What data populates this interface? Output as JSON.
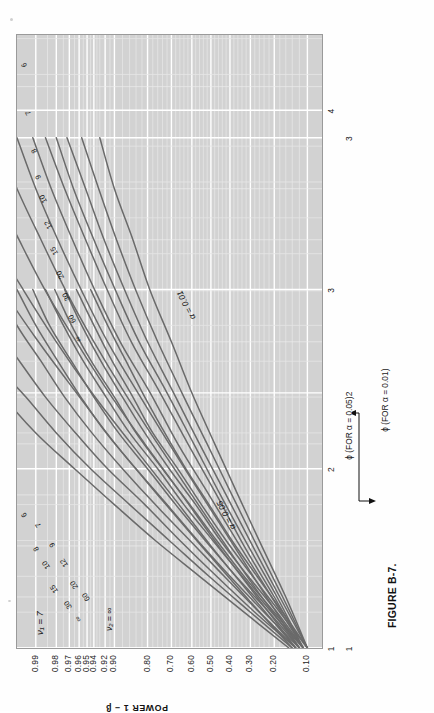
{
  "figure": {
    "caption": "FIGURE B-7.",
    "orientation": "rotated-90-ccw"
  },
  "colors": {
    "plot_background": "#d2d2d2",
    "grid_line": "#ffffff",
    "grid_minor": "#e4e4e4",
    "curve": "#6a6a6a",
    "frame": "#9a9a9a",
    "text": "#111111",
    "page_background": "#fefefe"
  },
  "axes": {
    "y_title": "POWER 1 − β",
    "y_ticks": [
      "0.99",
      "0.98",
      "0.97",
      "0.96",
      "0.95",
      "0.94",
      "0.92",
      "0.90",
      "0.80",
      "0.70",
      "0.60",
      "0.50",
      "0.40",
      "0.30",
      "0.20",
      "0.10"
    ],
    "phi05_label": "ϕ (FOR α = 0.05)",
    "phi05_ticks": [
      "1",
      "2",
      "3",
      "4"
    ],
    "phi01_label": "ϕ (FOR α = 0.01)",
    "phi01_ticks": [
      "1",
      "2",
      "3"
    ]
  },
  "annotations": {
    "nu_numerator": "ν₁ = 7",
    "nu_denominator": "ν₂ = ∞",
    "alpha_005": "α = 0.05",
    "alpha_001": "α = 0.01"
  },
  "curve_labels": [
    "∞",
    "60",
    "30",
    "20",
    "15",
    "12",
    "10",
    "9",
    "8",
    "7",
    "6"
  ],
  "chart_data": {
    "type": "line",
    "title": "FIGURE B-7.",
    "subtitle": "Pearson–Hartley power curves for the analysis of variance, ν₁ = 7",
    "xlabel": "ϕ (FOR α = 0.05)  /  ϕ (FOR α = 0.01)",
    "ylabel": "POWER 1 − β",
    "grid": true,
    "legend": "curve-end labels (ν₂ denominator degrees of freedom)",
    "y_tick_values": [
      0.99,
      0.98,
      0.97,
      0.96,
      0.95,
      0.94,
      0.92,
      0.9,
      0.8,
      0.7,
      0.6,
      0.5,
      0.4,
      0.3,
      0.2,
      0.1
    ],
    "y_tick_labels": [
      "0.99",
      "0.98",
      "0.97",
      "0.96",
      "0.95",
      "0.94",
      "0.92",
      "0.90",
      "0.80",
      "0.70",
      "0.60",
      "0.50",
      "0.40",
      "0.30",
      "0.20",
      "0.10"
    ],
    "panels": [
      {
        "name": "alpha = 0.05",
        "alpha": 0.05,
        "x_ticks": [
          1,
          2,
          3,
          4
        ],
        "xlim": [
          1,
          4.4
        ],
        "series": [
          {
            "name": "ν₂ = 6",
            "x": [
              1.0,
              1.2,
              1.4,
              1.6,
              1.8,
              2.0,
              2.2,
              2.4,
              2.6,
              2.8,
              3.0
            ],
            "y": [
              0.1,
              0.17,
              0.27,
              0.39,
              0.51,
              0.63,
              0.73,
              0.81,
              0.87,
              0.915,
              0.945
            ]
          },
          {
            "name": "ν₂ = 7",
            "x": [
              1.0,
              1.2,
              1.4,
              1.6,
              1.8,
              2.0,
              2.2,
              2.4,
              2.6,
              2.8,
              3.0
            ],
            "y": [
              0.1,
              0.18,
              0.29,
              0.42,
              0.55,
              0.67,
              0.78,
              0.85,
              0.905,
              0.94,
              0.963
            ]
          },
          {
            "name": "ν₂ = 8",
            "x": [
              1.0,
              1.2,
              1.4,
              1.6,
              1.8,
              2.0,
              2.2,
              2.4,
              2.6,
              2.8,
              3.0
            ],
            "y": [
              0.11,
              0.19,
              0.31,
              0.45,
              0.58,
              0.71,
              0.81,
              0.88,
              0.928,
              0.957,
              0.974
            ]
          },
          {
            "name": "ν₂ = 9",
            "x": [
              1.0,
              1.2,
              1.4,
              1.6,
              1.8,
              2.0,
              2.2,
              2.4,
              2.6,
              2.8,
              3.0
            ],
            "y": [
              0.11,
              0.2,
              0.33,
              0.47,
              0.61,
              0.74,
              0.84,
              0.9,
              0.944,
              0.968,
              0.981
            ]
          },
          {
            "name": "ν₂ = 10",
            "x": [
              1.0,
              1.2,
              1.4,
              1.6,
              1.8,
              2.0,
              2.2,
              2.4,
              2.6,
              2.8,
              3.0
            ],
            "y": [
              0.11,
              0.21,
              0.34,
              0.49,
              0.64,
              0.76,
              0.86,
              0.918,
              0.955,
              0.975,
              0.986
            ]
          },
          {
            "name": "ν₂ = 12",
            "x": [
              1.0,
              1.2,
              1.4,
              1.6,
              1.8,
              2.0,
              2.2,
              2.4,
              2.6,
              2.8,
              3.0
            ],
            "y": [
              0.12,
              0.22,
              0.37,
              0.53,
              0.68,
              0.8,
              0.89,
              0.94,
              0.968,
              0.984,
              0.991
            ]
          },
          {
            "name": "ν₂ = 15",
            "x": [
              1.0,
              1.2,
              1.4,
              1.6,
              1.8,
              2.0,
              2.2,
              2.4,
              2.6,
              2.8,
              3.0
            ],
            "y": [
              0.12,
              0.24,
              0.4,
              0.57,
              0.72,
              0.84,
              0.918,
              0.958,
              0.979,
              0.99,
              0.995
            ]
          },
          {
            "name": "ν₂ = 20",
            "x": [
              1.0,
              1.2,
              1.4,
              1.6,
              1.8,
              2.0,
              2.2,
              2.4,
              2.6,
              2.8,
              3.0
            ],
            "y": [
              0.13,
              0.26,
              0.43,
              0.61,
              0.77,
              0.88,
              0.943,
              0.974,
              0.988,
              0.995,
              0.9975
            ]
          },
          {
            "name": "ν₂ = 30",
            "x": [
              1.0,
              1.2,
              1.4,
              1.6,
              1.8,
              2.0,
              2.2,
              2.4,
              2.6,
              2.8,
              3.0
            ],
            "y": [
              0.13,
              0.28,
              0.47,
              0.66,
              0.81,
              0.915,
              0.964,
              0.986,
              0.9945,
              0.998,
              0.9992
            ]
          },
          {
            "name": "ν₂ = 60",
            "x": [
              1.0,
              1.2,
              1.4,
              1.6,
              1.8,
              2.0,
              2.2,
              2.4,
              2.6,
              2.8,
              3.0
            ],
            "y": [
              0.14,
              0.3,
              0.51,
              0.71,
              0.86,
              0.945,
              0.98,
              0.993,
              0.998,
              0.9993,
              0.9998
            ]
          },
          {
            "name": "ν₂ = ∞",
            "x": [
              1.0,
              1.2,
              1.4,
              1.6,
              1.8,
              2.0,
              2.2,
              2.4,
              2.6,
              2.8,
              3.0
            ],
            "y": [
              0.15,
              0.33,
              0.56,
              0.77,
              0.9,
              0.965,
              0.99,
              0.997,
              0.9992,
              0.9998,
              0.99995
            ]
          }
        ]
      },
      {
        "name": "alpha = 0.01",
        "alpha": 0.01,
        "x_ticks": [
          1,
          2,
          3
        ],
        "xlim": [
          1,
          3.4
        ],
        "series": [
          {
            "name": "ν₂ = 6",
            "x": [
              1.0,
              1.2,
              1.4,
              1.6,
              1.8,
              2.0,
              2.2,
              2.4,
              2.6,
              2.8,
              3.0
            ],
            "y": [
              0.1,
              0.16,
              0.25,
              0.36,
              0.48,
              0.6,
              0.7,
              0.79,
              0.85,
              0.9,
              0.93
            ]
          },
          {
            "name": "ν₂ = 7",
            "x": [
              1.0,
              1.2,
              1.4,
              1.6,
              1.8,
              2.0,
              2.2,
              2.4,
              2.6,
              2.8,
              3.0
            ],
            "y": [
              0.1,
              0.17,
              0.27,
              0.39,
              0.52,
              0.65,
              0.76,
              0.84,
              0.895,
              0.932,
              0.957
            ]
          },
          {
            "name": "ν₂ = 8",
            "x": [
              1.0,
              1.2,
              1.4,
              1.6,
              1.8,
              2.0,
              2.2,
              2.4,
              2.6,
              2.8,
              3.0
            ],
            "y": [
              0.1,
              0.18,
              0.29,
              0.42,
              0.56,
              0.69,
              0.8,
              0.873,
              0.922,
              0.952,
              0.972
            ]
          },
          {
            "name": "ν₂ = 9",
            "x": [
              1.0,
              1.2,
              1.4,
              1.6,
              1.8,
              2.0,
              2.2,
              2.4,
              2.6,
              2.8,
              3.0
            ],
            "y": [
              0.11,
              0.19,
              0.31,
              0.45,
              0.59,
              0.72,
              0.83,
              0.897,
              0.94,
              0.966,
              0.98
            ]
          },
          {
            "name": "ν₂ = 10",
            "x": [
              1.0,
              1.2,
              1.4,
              1.6,
              1.8,
              2.0,
              2.2,
              2.4,
              2.6,
              2.8,
              3.0
            ],
            "y": [
              0.11,
              0.2,
              0.33,
              0.47,
              0.62,
              0.75,
              0.855,
              0.915,
              0.952,
              0.974,
              0.986
            ]
          },
          {
            "name": "ν₂ = 12",
            "x": [
              1.0,
              1.2,
              1.4,
              1.6,
              1.8,
              2.0,
              2.2,
              2.4,
              2.6,
              2.8,
              3.0
            ],
            "y": [
              0.11,
              0.21,
              0.35,
              0.51,
              0.67,
              0.79,
              0.886,
              0.938,
              0.967,
              0.983,
              0.991
            ]
          },
          {
            "name": "ν₂ = 15",
            "x": [
              1.0,
              1.2,
              1.4,
              1.6,
              1.8,
              2.0,
              2.2,
              2.4,
              2.6,
              2.8,
              3.0
            ],
            "y": [
              0.12,
              0.23,
              0.38,
              0.55,
              0.71,
              0.834,
              0.915,
              0.957,
              0.979,
              0.99,
              0.995
            ]
          },
          {
            "name": "ν₂ = 20",
            "x": [
              1.0,
              1.2,
              1.4,
              1.6,
              1.8,
              2.0,
              2.2,
              2.4,
              2.6,
              2.8,
              3.0
            ],
            "y": [
              0.12,
              0.25,
              0.42,
              0.6,
              0.76,
              0.874,
              0.94,
              0.973,
              0.988,
              0.995,
              0.9978
            ]
          },
          {
            "name": "ν₂ = 30",
            "x": [
              1.0,
              1.2,
              1.4,
              1.6,
              1.8,
              2.0,
              2.2,
              2.4,
              2.6,
              2.8,
              3.0
            ],
            "y": [
              0.13,
              0.27,
              0.46,
              0.65,
              0.81,
              0.912,
              0.963,
              0.986,
              0.9946,
              0.998,
              0.9993
            ]
          },
          {
            "name": "ν₂ = 60",
            "x": [
              1.0,
              1.2,
              1.4,
              1.6,
              1.8,
              2.0,
              2.2,
              2.4,
              2.6,
              2.8,
              3.0
            ],
            "y": [
              0.13,
              0.29,
              0.5,
              0.7,
              0.855,
              0.943,
              0.98,
              0.9935,
              0.998,
              0.9994,
              0.9998
            ]
          },
          {
            "name": "ν₂ = ∞",
            "x": [
              1.0,
              1.2,
              1.4,
              1.6,
              1.8,
              2.0,
              2.2,
              2.4,
              2.6,
              2.8,
              3.0
            ],
            "y": [
              0.14,
              0.32,
              0.55,
              0.76,
              0.898,
              0.963,
              0.989,
              0.997,
              0.9992,
              0.9998,
              0.99995
            ]
          }
        ]
      }
    ]
  }
}
